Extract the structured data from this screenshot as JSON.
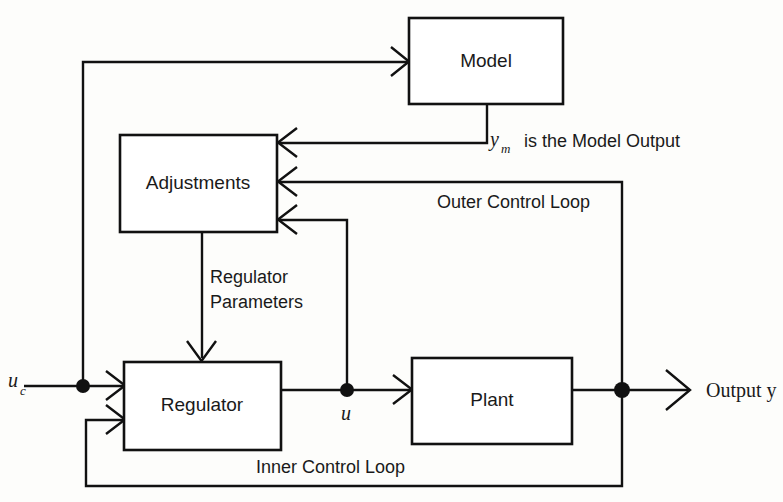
{
  "diagram": {
    "accent_color": "#111111",
    "background_color": "#fdfdfb",
    "blocks": [
      {
        "id": "model",
        "label": "Model",
        "x": 409,
        "y": 18,
        "w": 154,
        "h": 86
      },
      {
        "id": "adjustments",
        "label": "Adjustments",
        "x": 120,
        "y": 135,
        "w": 157,
        "h": 97
      },
      {
        "id": "regulator",
        "label": "Regulator",
        "x": 124,
        "y": 362,
        "w": 157,
        "h": 88
      },
      {
        "id": "plant",
        "label": "Plant",
        "x": 412,
        "y": 358,
        "w": 160,
        "h": 86
      }
    ],
    "signals": {
      "command_input": "u",
      "command_input_sub": "c",
      "control_signal": "u",
      "model_output": "y",
      "model_output_sub": "m",
      "model_output_note": "is the Model Output",
      "plant_output": "Output  y"
    },
    "annotations": {
      "regulator_parameters_line1": "Regulator",
      "regulator_parameters_line2": "Parameters",
      "outer_loop": "Outer Control Loop",
      "inner_loop": "Inner Control Loop"
    },
    "junctions": [
      {
        "id": "uc-junction",
        "x": 83,
        "y": 386,
        "r": 7
      },
      {
        "id": "u-junction",
        "x": 347,
        "y": 390,
        "r": 7
      },
      {
        "id": "output-junction",
        "x": 622,
        "y": 390,
        "r": 8
      }
    ]
  }
}
